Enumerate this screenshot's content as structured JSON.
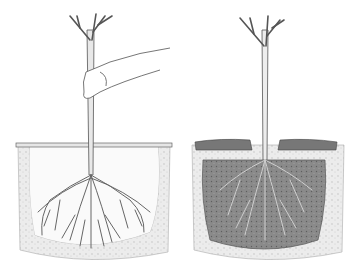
{
  "image": {
    "description": "Two-panel pencil illustration of planting a bare-root tree",
    "panels": [
      {
        "id": "left",
        "subject": "hand holding trunk, stick laid across hole at ground level, roots spread in open hole"
      },
      {
        "id": "right",
        "subject": "hole backfilled with soil covering roots, tree standing upright"
      }
    ],
    "colors": {
      "background": "#ffffff",
      "line": "#555555",
      "soil_light": "#dcdcdc",
      "soil_dark": "#7a7a7a",
      "fill_dark": "#8c8c8c"
    }
  }
}
